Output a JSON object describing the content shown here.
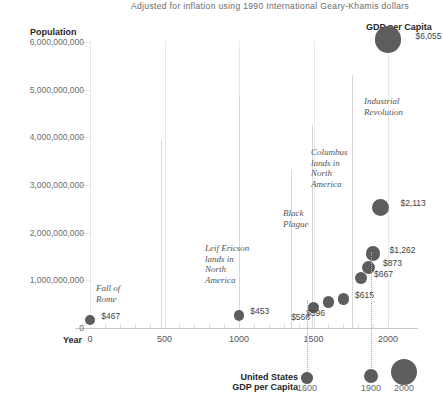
{
  "subtitle": "Adjusted for inflation using 1990 International Geary-Khamis dollars",
  "axes": {
    "y_title": "Population",
    "x_title": "Year",
    "secondary_title": "GDP per Capita",
    "y_ticks": [
      "6,000,000,000",
      "5,000,000,000",
      "4,000,000,000",
      "3,000,000,000",
      "2,000,000,000",
      "1,000,000,000",
      "0"
    ],
    "x_ticks": [
      "0",
      "500",
      "1000",
      "1500",
      "2000"
    ]
  },
  "legend": {
    "title_line1": "United States",
    "title_line2": "GDP per Capita",
    "ticks": [
      "1600",
      "1900",
      "2000"
    ]
  },
  "points": [
    {
      "label": "$467",
      "year": 0,
      "population": 170000000,
      "gdp": 467
    },
    {
      "label": "$453",
      "year": 1000,
      "population": 265000000,
      "gdp": 453
    },
    {
      "label": "$566",
      "year": 1500,
      "population": 425000000,
      "gdp": 566
    },
    {
      "label": "$596",
      "year": 1600,
      "population": 545000000,
      "gdp": 596
    },
    {
      "label": "$615",
      "year": 1700,
      "population": 610000000,
      "gdp": 615
    },
    {
      "label": "$667",
      "year": 1820,
      "population": 1040000000,
      "gdp": 667
    },
    {
      "label": "$873",
      "year": 1870,
      "population": 1270000000,
      "gdp": 873
    },
    {
      "label": "$1,262",
      "year": 1900,
      "population": 1560000000,
      "gdp": 1262
    },
    {
      "label": "$2,113",
      "year": 1950,
      "population": 2530000000,
      "gdp": 2113
    },
    {
      "label": "$6,055",
      "year": 2000,
      "population": 6050000000,
      "gdp": 6055
    }
  ],
  "annotations": [
    {
      "text_lines": [
        "Fall of",
        "Rome"
      ],
      "name": "fall-of-rome"
    },
    {
      "text_lines": [
        "Leif Ericson",
        "lands in",
        "North",
        "America"
      ],
      "name": "leif-ericson"
    },
    {
      "text_lines": [
        "Black",
        "Plague"
      ],
      "name": "black-plague"
    },
    {
      "text_lines": [
        "Columbus",
        "lands in",
        "North",
        "America"
      ],
      "name": "columbus"
    },
    {
      "text_lines": [
        "Industrial",
        "Revolution"
      ],
      "name": "industrial-revolution"
    }
  ],
  "colors": {
    "bubble": "#5d5d5d",
    "grid": "#e8e8e8",
    "text": "#3d3d3d"
  },
  "chart_data": {
    "type": "scatter",
    "title": "",
    "subtitle": "Adjusted for inflation using 1990 International Geary-Khamis dollars",
    "xlabel": "Year",
    "ylabel": "Population",
    "size_label": "GDP per Capita",
    "xlim": [
      0,
      2000
    ],
    "ylim": [
      0,
      6000000000
    ],
    "xticks": [
      0,
      500,
      1000,
      1500,
      2000
    ],
    "yticks": [
      0,
      1000000000,
      2000000000,
      3000000000,
      4000000000,
      5000000000,
      6000000000
    ],
    "grid": true,
    "legend": "bottom-right",
    "x": [
      0,
      1000,
      1500,
      1600,
      1700,
      1820,
      1870,
      1900,
      1950,
      2000
    ],
    "y": [
      170000000,
      265000000,
      425000000,
      545000000,
      610000000,
      1040000000,
      1270000000,
      1560000000,
      2530000000,
      6050000000
    ],
    "sizes": [
      467,
      453,
      566,
      596,
      615,
      667,
      873,
      1262,
      2113,
      6055
    ],
    "point_labels": [
      "$467",
      "$453",
      "$566",
      "$596",
      "$615",
      "$667",
      "$873",
      "$1,262",
      "$2,113",
      "$6,055"
    ],
    "annotations": [
      {
        "label": "Fall of Rome",
        "year": 476
      },
      {
        "label": "Leif Ericson lands in North America",
        "year": 1000
      },
      {
        "label": "Black Plague",
        "year": 1350
      },
      {
        "label": "Columbus lands in North America",
        "year": 1492
      },
      {
        "label": "Industrial Revolution",
        "year": 1760
      }
    ]
  }
}
